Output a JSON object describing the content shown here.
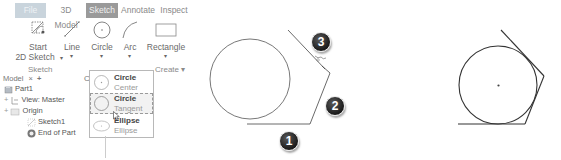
{
  "ribbon": {
    "tabs": [
      {
        "label": "File",
        "state": "faded"
      },
      {
        "label": "3D Model",
        "state": "normal"
      },
      {
        "label": "Sketch",
        "state": "active"
      },
      {
        "label": "Annotate",
        "state": "normal"
      },
      {
        "label": "Inspect",
        "state": "normal"
      }
    ],
    "tools": [
      {
        "label_line1": "Start",
        "label_line2": "2D Sketch",
        "icon": "start-2d-sketch-icon"
      },
      {
        "label_line1": "Line",
        "icon": "line-icon"
      },
      {
        "label_line1": "Circle",
        "icon": "circle-icon"
      },
      {
        "label_line1": "Arc",
        "icon": "arc-icon"
      },
      {
        "label_line1": "Rectangle",
        "icon": "rectangle-icon"
      }
    ],
    "panels": {
      "sketch": "Sketch",
      "create": "Create",
      "create_caret": "▾"
    },
    "caret": "▾"
  },
  "circle_dropdown": {
    "items": [
      {
        "title": "Circle",
        "subtitle": "Center Point",
        "icon": "circle-center-point-icon"
      },
      {
        "title": "Circle",
        "subtitle": "Tangent",
        "icon": "circle-tangent-icon",
        "highlighted": true
      },
      {
        "title": "Ellipse",
        "subtitle": "Ellipse",
        "icon": "ellipse-icon"
      }
    ]
  },
  "model_browser": {
    "title": "Model",
    "close": "×",
    "add": "+",
    "partial_letter": "C",
    "items": [
      {
        "label": "Part1",
        "icon": "part-icon",
        "expander": ""
      },
      {
        "label": "View: Master",
        "icon": "view-icon",
        "expander": "+"
      },
      {
        "label": "Origin",
        "icon": "folder-icon",
        "expander": "+"
      },
      {
        "label": "Sketch1",
        "icon": "sketch-icon",
        "expander": ""
      },
      {
        "label": "End of Part",
        "icon": "end-of-part-icon",
        "expander": ""
      }
    ]
  },
  "diagram": {
    "step_badges": [
      "1",
      "2",
      "3"
    ],
    "line_color": "#333333"
  }
}
